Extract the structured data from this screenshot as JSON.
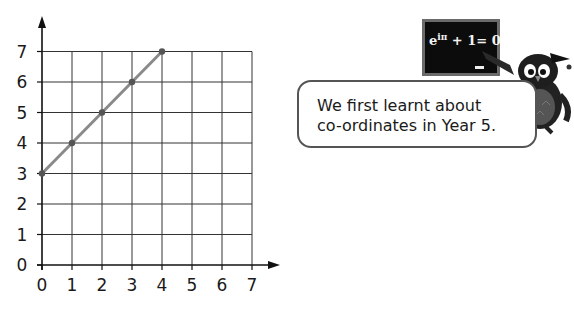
{
  "chart_data": {
    "type": "line",
    "title": "",
    "xlabel": "",
    "ylabel": "",
    "x_ticks": [
      "0",
      "1",
      "2",
      "3",
      "4",
      "5",
      "6",
      "7"
    ],
    "y_ticks": [
      "0",
      "1",
      "2",
      "3",
      "4",
      "5",
      "6",
      "7"
    ],
    "xlim": [
      0,
      7
    ],
    "ylim": [
      0,
      7
    ],
    "grid": true,
    "legend": "none",
    "series": [
      {
        "name": "line",
        "x": [
          0,
          1,
          2,
          3,
          4
        ],
        "y": [
          3,
          4,
          5,
          6,
          7
        ]
      }
    ]
  },
  "speech_bubble": {
    "text": "We first learnt about\nco-ordinates in Year 5."
  },
  "chalkboard": {
    "formula_base": "e",
    "formula_exp": "iπ",
    "formula_rest": " + 1= 0"
  },
  "colors": {
    "grid": "#333333",
    "line": "#8a8a8a",
    "point": "#555555",
    "board": "#0c0c0c"
  }
}
